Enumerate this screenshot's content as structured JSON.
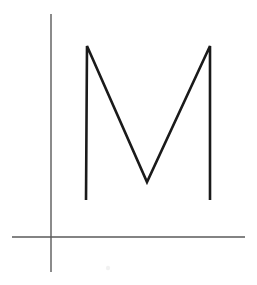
{
  "canvas": {
    "width": 257,
    "height": 285,
    "background_color": "#ffffff",
    "title": "Letter M on Axes"
  },
  "colors": {
    "axis_stroke": "#5a5a5a",
    "glyph_stroke": "#1a1a1a",
    "faint_mark": "#d8d8d8",
    "background": "#ffffff"
  },
  "axes": {
    "name": "coordinate-axes",
    "stroke_width": 1.4,
    "vertical": {
      "label": "vertical-axis",
      "x": 51,
      "y_top": 14,
      "y_bottom": 272
    },
    "horizontal": {
      "label": "horizontal-axis",
      "y": 237,
      "x_left": 12,
      "x_right": 245
    },
    "origin": {
      "x": 51,
      "y": 237
    }
  },
  "glyph": {
    "name": "letter-m",
    "character": "M",
    "stroke_width": 2.6,
    "stroke_color": "#1a1a1a",
    "bounds": {
      "left": 86,
      "right": 210,
      "top": 46,
      "bottom": 200
    },
    "vertices": [
      {
        "name": "left-stem-bottom",
        "x": 86,
        "y": 200
      },
      {
        "name": "left-apex",
        "x": 87,
        "y": 46
      },
      {
        "name": "middle-valley",
        "x": 147,
        "y": 182
      },
      {
        "name": "right-apex",
        "x": 210,
        "y": 46
      },
      {
        "name": "right-stem-bottom",
        "x": 210,
        "y": 200
      }
    ],
    "path": "M 86 200 L 87 46 L 147 182 L 210 46 L 210 200"
  },
  "artifacts": {
    "faint_mark": {
      "name": "faint-smudge",
      "x": 108,
      "y": 268,
      "radius": 2.2,
      "opacity": 0.35
    }
  }
}
